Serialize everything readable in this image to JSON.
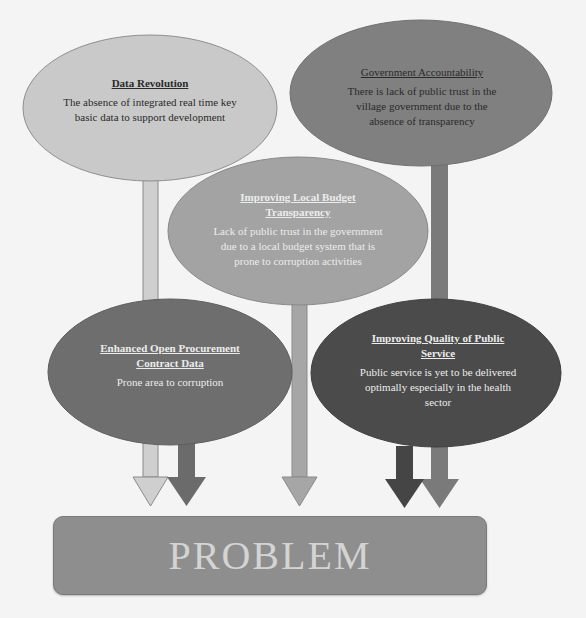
{
  "diagram": {
    "nodes": [
      {
        "id": "data-revolution",
        "title": "Data Revolution",
        "description": "The absence of integrated real time key basic data to support development",
        "fill": "#c9c9c9"
      },
      {
        "id": "government-accountability",
        "title": "Government Accountability",
        "description": "There is lack of public trust in the village government due to the absence of transparency",
        "fill": "#808080"
      },
      {
        "id": "local-budget-transparency",
        "title": "Improving Local Budget Transparency",
        "description": "Lack of public trust in the government due to a local budget system that is prone to corruption activities",
        "fill": "#a3a3a3"
      },
      {
        "id": "open-procurement",
        "title": "Enhanced Open Procurement Contract Data",
        "description": "Prone area to corruption",
        "fill": "#6e6e6e"
      },
      {
        "id": "public-service-quality",
        "title": "Improving Quality of Public Service",
        "description": "Public service is yet to be delivered optimally especially in the health sector",
        "fill": "#4b4b4b"
      }
    ],
    "target": {
      "label": "PROBLEM",
      "fill": "#8e8e8e"
    },
    "edges": [
      {
        "from": "data-revolution",
        "to": "PROBLEM"
      },
      {
        "from": "government-accountability",
        "to": "PROBLEM"
      },
      {
        "from": "local-budget-transparency",
        "to": "PROBLEM"
      },
      {
        "from": "open-procurement",
        "to": "PROBLEM"
      },
      {
        "from": "public-service-quality",
        "to": "PROBLEM"
      }
    ]
  }
}
